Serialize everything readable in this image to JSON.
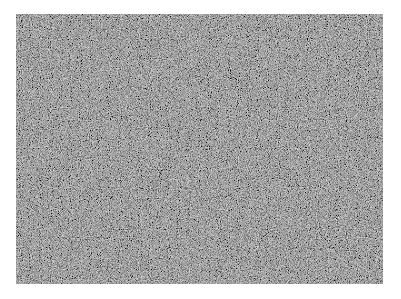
{
  "image": {
    "description": "Uniform grayscale random noise texture",
    "background_color": "#ffffff",
    "noise_base_color": "#6e6e6e",
    "noise_region": {
      "x": 16,
      "y": 14,
      "width": 367,
      "height": 270
    }
  }
}
